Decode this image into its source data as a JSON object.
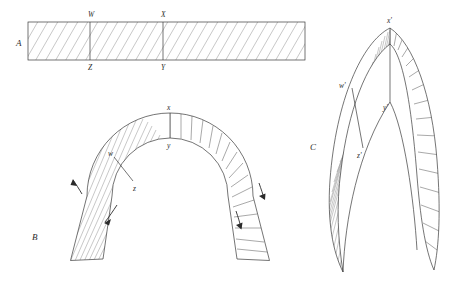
{
  "figure": {
    "background_color": "#ffffff",
    "ink_color": "#2b2b2b",
    "hatch_color": "#9a9a9a",
    "width": 461,
    "height": 286
  },
  "panels": [
    {
      "id": "A",
      "label": "A",
      "label_x": 16,
      "label_y": 46,
      "caption": "Straight hatched strip divided into three bays",
      "shape": "rectangle",
      "rect": {
        "x": 28,
        "y": 22,
        "width": 277,
        "height": 38
      },
      "hatch": {
        "style": "diagonal",
        "angle_deg": 30,
        "spacing": 9
      },
      "dividers": [
        90,
        163
      ],
      "points": [
        {
          "label": "W",
          "x": 90,
          "y": 22,
          "anchor": "top",
          "label_x": 88,
          "label_y": 17
        },
        {
          "label": "X",
          "x": 163,
          "y": 22,
          "anchor": "top",
          "label_x": 161,
          "label_y": 17
        },
        {
          "label": "Z",
          "x": 90,
          "y": 60,
          "anchor": "bottom",
          "label_x": 88,
          "label_y": 70
        },
        {
          "label": "Y",
          "x": 163,
          "y": 60,
          "anchor": "bottom",
          "label_x": 161,
          "label_y": 70
        }
      ]
    },
    {
      "id": "B",
      "label": "B",
      "label_x": 32,
      "label_y": 240,
      "caption": "Round (semicircular) arch formed from the strip",
      "shape": "round-arch",
      "center": {
        "x": 170,
        "y": 196
      },
      "inner_radius": 58,
      "outer_radius": 83,
      "springing_angle_deg": 186,
      "points": [
        {
          "label": "w",
          "x": 118,
          "y": 160,
          "label_x": 110,
          "label_y": 157
        },
        {
          "label": "x",
          "x": 170,
          "y": 135,
          "label_x": 167,
          "label_y": 130
        },
        {
          "label": "y",
          "x": 170,
          "y": 190,
          "label_x": 167,
          "label_y": 196
        },
        {
          "label": "z",
          "x": 134,
          "y": 181,
          "label_x": 133,
          "label_y": 192
        }
      ],
      "arrows": [
        {
          "name": "arrow-upper-left",
          "x": 74,
          "y": 186,
          "direction": "up-left"
        },
        {
          "name": "arrow-lower-left",
          "x": 106,
          "y": 215,
          "direction": "down-left"
        },
        {
          "name": "arrow-upper-right",
          "x": 263,
          "y": 190,
          "direction": "down-right"
        },
        {
          "name": "arrow-lower-right",
          "x": 240,
          "y": 222,
          "direction": "down"
        }
      ],
      "hatch_left": {
        "style": "radial-diagonal",
        "count": 26
      },
      "rules_right": {
        "style": "voussoir-joints",
        "count": 15
      }
    },
    {
      "id": "C",
      "label": "C",
      "label_x": 310,
      "label_y": 150,
      "caption": "Pointed (gothic) arch formed from the same strip",
      "shape": "pointed-arch",
      "apex": {
        "x": 390,
        "y": 28
      },
      "left_springing": {
        "x": 343,
        "y": 272
      },
      "right_springing": {
        "x": 434,
        "y": 270
      },
      "points": [
        {
          "label": "w'",
          "x": 352,
          "y": 88,
          "label_x": 340,
          "label_y": 88
        },
        {
          "label": "x'",
          "x": 390,
          "y": 28,
          "label_x": 387,
          "label_y": 23
        },
        {
          "label": "y'",
          "x": 390,
          "y": 102,
          "label_x": 384,
          "label_y": 110
        },
        {
          "label": "z'",
          "x": 363,
          "y": 148,
          "label_x": 358,
          "label_y": 158
        }
      ],
      "hatch_left": {
        "style": "radial-diagonal",
        "count": 28
      },
      "rules_right": {
        "style": "voussoir-joints",
        "count": 14
      }
    }
  ]
}
